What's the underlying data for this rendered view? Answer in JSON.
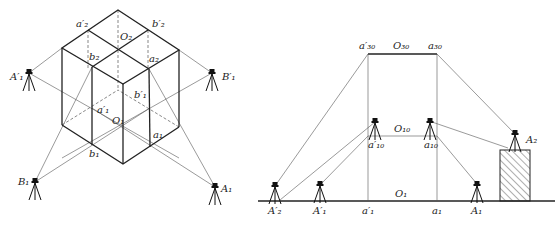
{
  "left_figure": {
    "title": "isometric axis transfer",
    "labels": {
      "a2p": "a′₂",
      "b2p": "b′₂",
      "O2": "O₂",
      "b2": "b₂",
      "a2": "a₂",
      "A1p": "A′₁",
      "B1p": "B′₁",
      "a1p": "a′₁",
      "b1p": "b′₁",
      "O1": "O₁",
      "a1": "a₁",
      "b1": "b₁",
      "B1": "B₁",
      "A1": "A₁"
    }
  },
  "right_figure": {
    "title": "elevation axis transfer",
    "labels": {
      "a30p": "a′₃₀",
      "O30": "O₃₀",
      "a30": "a₃₀",
      "a10p": "a′₁₀",
      "O10": "O₁₀",
      "a10": "a₁₀",
      "A2": "A₂",
      "A2p": "A′₂",
      "A1p": "A′₁",
      "a1p": "a′₁",
      "O1": "O₁",
      "a1": "a₁",
      "A1": "A₁"
    }
  }
}
